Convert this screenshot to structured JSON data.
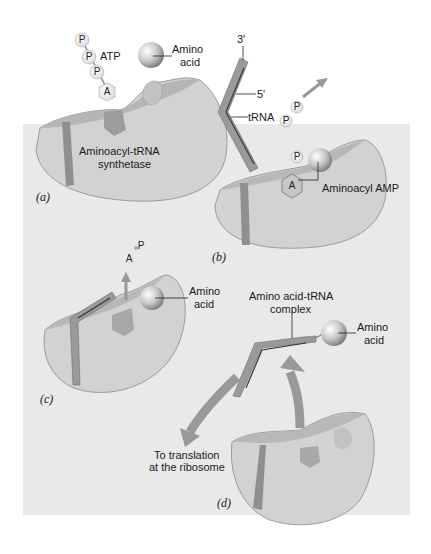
{
  "figure": {
    "colors": {
      "background_panel": "#e9e9e9",
      "enzyme_fill": "#cfcfcf",
      "enzyme_top": "#b9b9b9",
      "trna": "#8f8f8f",
      "arrow": "#9a9a9a",
      "text": "#1a1a1a"
    }
  },
  "panels": {
    "a": {
      "tag": "(a)",
      "atp_label": "ATP",
      "phosphates": [
        "P",
        "P",
        "P"
      ],
      "adenosine": "A",
      "amino_acid_label_line1": "Amino",
      "amino_acid_label_line2": "acid",
      "enzyme_label_line1": "Aminoacyl-tRNA",
      "enzyme_label_line2": "synthetase"
    },
    "b": {
      "tag": "(b)",
      "three_prime": "3'",
      "five_prime": "5'",
      "trna_label": "tRNA",
      "released_phosphates": [
        "P",
        "P"
      ],
      "bound_phosphate": "P",
      "adenosine": "A",
      "intermediate_label": "Aminoacyl AMP"
    },
    "c": {
      "tag": "(c)",
      "released_phosphate": "P",
      "released_adenosine": "A",
      "amino_acid_label_line1": "Amino",
      "amino_acid_label_line2": "acid"
    },
    "d": {
      "tag": "(d)",
      "complex_label_line1": "Amino acid-tRNA",
      "complex_label_line2": "complex",
      "amino_acid_label_line1": "Amino",
      "amino_acid_label_line2": "acid",
      "destination_line1": "To translation",
      "destination_line2": "at the ribosome"
    }
  }
}
